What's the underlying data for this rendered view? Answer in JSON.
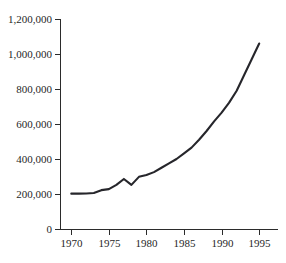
{
  "chart_data": {
    "type": "line",
    "title": "",
    "subtitle": "",
    "xlabel": "",
    "ylabel": "",
    "xlim": [
      1968.5,
      1997.5
    ],
    "ylim": [
      0,
      1200000
    ],
    "grid": false,
    "legend": null,
    "legend_position": "none",
    "line_color": "#26262b",
    "axis_color": "#2b2b2b",
    "background_color": "#ffffff",
    "x_ticks": [
      1970,
      1975,
      1980,
      1985,
      1990,
      1995
    ],
    "x_tick_labels": [
      "1970",
      "1975",
      "1980",
      "1985",
      "1990",
      "1995"
    ],
    "y_ticks": [
      0,
      200000,
      400000,
      600000,
      800000,
      1000000,
      1200000
    ],
    "y_tick_labels": [
      "0",
      "200,000",
      "400,000",
      "600,000",
      "800,000",
      "1,000,000",
      "1,200,000"
    ],
    "x": [
      1970,
      1971,
      1972,
      1973,
      1974,
      1975,
      1976,
      1977,
      1978,
      1979,
      1980,
      1981,
      1982,
      1983,
      1984,
      1985,
      1986,
      1987,
      1988,
      1989,
      1990,
      1991,
      1992,
      1993,
      1994,
      1995
    ],
    "values": [
      202000,
      202000,
      203000,
      206000,
      222000,
      228000,
      252000,
      286000,
      252000,
      298000,
      308000,
      325000,
      350000,
      375000,
      400000,
      432000,
      465000,
      510000,
      560000,
      615000,
      665000,
      722000,
      790000,
      880000,
      970000,
      1060000
    ],
    "series": [
      {
        "name": "series-1",
        "color": "#26262b",
        "values": [
          202000,
          202000,
          203000,
          206000,
          222000,
          228000,
          252000,
          286000,
          252000,
          298000,
          308000,
          325000,
          350000,
          375000,
          400000,
          432000,
          465000,
          510000,
          560000,
          615000,
          665000,
          722000,
          790000,
          880000,
          970000,
          1060000
        ]
      }
    ],
    "annotations": []
  },
  "figure": {
    "plot_left_px": 60,
    "plot_right_px": 278,
    "plot_top_px": 19,
    "plot_bottom_px": 229
  }
}
